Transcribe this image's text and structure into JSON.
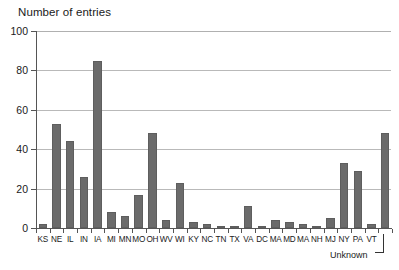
{
  "chart_data": {
    "type": "bar",
    "title": "Number of entries",
    "xlabel": "",
    "ylabel": "Number of entries",
    "ylim": [
      0,
      100
    ],
    "yticks": [
      0,
      20,
      40,
      60,
      80,
      100
    ],
    "grid": true,
    "legend": null,
    "annotations": [
      {
        "text": "Unknown",
        "target_category": "VT+1",
        "note": "bracket leader pointing to final unlabeled bar"
      }
    ],
    "categories": [
      "KS",
      "NE",
      "IL",
      "IN",
      "IA",
      "MI",
      "MN",
      "MO",
      "OH",
      "WV",
      "WI",
      "KY",
      "NC",
      "TN",
      "TX",
      "VA",
      "DC",
      "MA",
      "MD",
      "MA",
      "NH",
      "MJ",
      "NY",
      "PA",
      "VT",
      ""
    ],
    "values": [
      2,
      53,
      44,
      26,
      85,
      8,
      6,
      17,
      48,
      4,
      23,
      3,
      2,
      1,
      1,
      11,
      1,
      4,
      3,
      2,
      1,
      5,
      33,
      29,
      2,
      48
    ]
  },
  "axis": {
    "y_title": "Number of entries",
    "tick_labels": [
      "100",
      "80",
      "60",
      "40",
      "20",
      "0"
    ]
  },
  "annotation": {
    "unknown_label": "Unknown"
  },
  "colors": {
    "bar_fill": "#6b6b6b",
    "bar_stroke": "#5e5e5e",
    "gridline": "#b9b9b9",
    "axis": "#555555",
    "text": "#1a1a1a",
    "background": "#ffffff"
  }
}
